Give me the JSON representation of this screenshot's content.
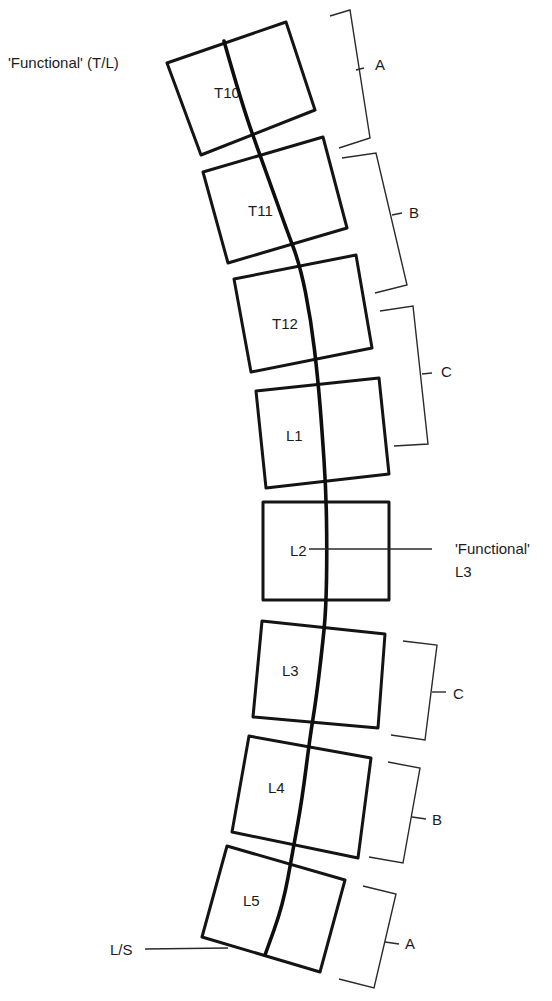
{
  "diagram": {
    "colors": {
      "stroke": "#141414",
      "text": "#1c1c1c",
      "background": "#ffffff"
    },
    "annotations": {
      "top_left": "'Functional' (T/L)",
      "mid_right_line1": "'Functional'",
      "mid_right_line2": "L3",
      "bottom_left": "L/S"
    },
    "vertebrae": [
      {
        "label": "T10",
        "corners": [
          [
            167,
            63
          ],
          [
            286,
            22
          ],
          [
            315,
            110
          ],
          [
            201,
            155
          ]
        ],
        "label_pos": [
          214,
          98
        ]
      },
      {
        "label": "T11",
        "corners": [
          [
            203,
            172
          ],
          [
            323,
            137
          ],
          [
            347,
            228
          ],
          [
            228,
            263
          ]
        ],
        "label_pos": [
          248,
          216
        ]
      },
      {
        "label": "T12",
        "corners": [
          [
            234,
            279
          ],
          [
            356,
            255
          ],
          [
            372,
            348
          ],
          [
            251,
            372
          ]
        ],
        "label_pos": [
          272,
          329
        ]
      },
      {
        "label": "L1",
        "corners": [
          [
            256,
            391
          ],
          [
            379,
            378
          ],
          [
            389,
            474
          ],
          [
            266,
            488
          ]
        ],
        "label_pos": [
          286,
          441
        ]
      },
      {
        "label": "L2",
        "corners": [
          [
            263,
            502
          ],
          [
            389,
            502
          ],
          [
            389,
            600
          ],
          [
            263,
            600
          ]
        ],
        "label_pos": [
          290,
          556
        ]
      },
      {
        "label": "L3",
        "corners": [
          [
            262,
            621
          ],
          [
            385,
            634
          ],
          [
            378,
            728
          ],
          [
            253,
            717
          ]
        ],
        "label_pos": [
          282,
          676
        ]
      },
      {
        "label": "L4",
        "corners": [
          [
            249,
            736
          ],
          [
            371,
            758
          ],
          [
            358,
            858
          ],
          [
            232,
            832
          ]
        ],
        "label_pos": [
          268,
          793
        ]
      },
      {
        "label": "L5",
        "corners": [
          [
            227,
            846
          ],
          [
            345,
            880
          ],
          [
            320,
            972
          ],
          [
            202,
            937
          ]
        ],
        "label_pos": [
          243,
          906
        ]
      }
    ],
    "spine_curve": [
      [
        224,
        41
      ],
      [
        242,
        105
      ],
      [
        264,
        166
      ],
      [
        286,
        228
      ],
      [
        300,
        265
      ],
      [
        311,
        320
      ],
      [
        318,
        380
      ],
      [
        322,
        430
      ],
      [
        326,
        490
      ],
      [
        327,
        550
      ],
      [
        326,
        610
      ],
      [
        322,
        650
      ],
      [
        316,
        700
      ],
      [
        310,
        737
      ],
      [
        302,
        800
      ],
      [
        293,
        850
      ],
      [
        283,
        905
      ],
      [
        265,
        955
      ]
    ],
    "brackets": [
      {
        "label": "A",
        "top": [
          [
            330,
            16
          ],
          [
            350,
            10
          ]
        ],
        "spine": [
          [
            350,
            10
          ],
          [
            370,
            138
          ]
        ],
        "bottom": [
          [
            370,
            138
          ],
          [
            339,
            148
          ]
        ],
        "tick": [
          [
            356,
            70
          ],
          [
            364,
            68
          ]
        ],
        "label_pos": [
          375,
          70
        ]
      },
      {
        "label": "B",
        "top": [
          [
            342,
            158
          ],
          [
            376,
            153
          ]
        ],
        "spine": [
          [
            376,
            153
          ],
          [
            407,
            285
          ]
        ],
        "bottom": [
          [
            407,
            285
          ],
          [
            375,
            293
          ]
        ],
        "tick": [
          [
            392,
            215
          ],
          [
            402,
            213
          ]
        ],
        "label_pos": [
          409,
          218
        ]
      },
      {
        "label": "C",
        "top": [
          [
            380,
            311
          ],
          [
            413,
            306
          ]
        ],
        "spine": [
          [
            413,
            306
          ],
          [
            428,
            444
          ]
        ],
        "bottom": [
          [
            428,
            444
          ],
          [
            394,
            446
          ]
        ],
        "tick": [
          [
            422,
            374
          ],
          [
            432,
            373
          ]
        ],
        "label_pos": [
          441,
          377
        ]
      },
      {
        "label": "C",
        "top": [
          [
            403,
            641
          ],
          [
            437,
            645
          ]
        ],
        "spine": [
          [
            437,
            645
          ],
          [
            425,
            740
          ]
        ],
        "bottom": [
          [
            425,
            740
          ],
          [
            391,
            735
          ]
        ],
        "tick": [
          [
            432,
            692
          ],
          [
            446,
            692
          ]
        ],
        "label_pos": [
          453,
          699
        ]
      },
      {
        "label": "B",
        "top": [
          [
            388,
            762
          ],
          [
            420,
            768
          ]
        ],
        "spine": [
          [
            420,
            768
          ],
          [
            403,
            863
          ]
        ],
        "bottom": [
          [
            403,
            863
          ],
          [
            369,
            857
          ]
        ],
        "tick": [
          [
            412,
            817
          ],
          [
            426,
            819
          ]
        ],
        "label_pos": [
          432,
          825
        ]
      },
      {
        "label": "A",
        "top": [
          [
            363,
            886
          ],
          [
            396,
            894
          ]
        ],
        "spine": [
          [
            396,
            894
          ],
          [
            374,
            988
          ]
        ],
        "bottom": [
          [
            374,
            988
          ],
          [
            339,
            979
          ]
        ],
        "tick": [
          [
            385,
            942
          ],
          [
            399,
            944
          ]
        ],
        "label_pos": [
          405,
          949
        ]
      }
    ],
    "leaders": [
      {
        "name": "functional-l3-leader",
        "points": [
          [
            309,
            549
          ],
          [
            432,
            549
          ]
        ]
      },
      {
        "name": "ls-leader",
        "points": [
          [
            145,
            949
          ],
          [
            228,
            948
          ]
        ]
      }
    ],
    "text_positions": {
      "top_left": [
        8,
        68
      ],
      "mid_right_line1": [
        455,
        554
      ],
      "mid_right_line2": [
        455,
        577
      ],
      "bottom_left": [
        110,
        955
      ]
    }
  }
}
